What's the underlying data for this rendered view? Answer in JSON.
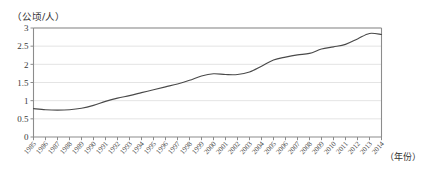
{
  "chart_data": {
    "type": "line",
    "title": "",
    "subtitle": "",
    "ylabel": "（公顷/人）",
    "xlabel": "（年份）",
    "xlabel_unit_text": "（年份）",
    "ylabel_unit_text": "（公顷/人）",
    "grid": true,
    "legend": "none",
    "ylim": [
      0,
      3
    ],
    "yticks": [
      0,
      0.5,
      1,
      1.5,
      2,
      2.5,
      3
    ],
    "ytick_labels": [
      "0",
      "0.5",
      "1",
      "1.5",
      "2",
      "2.5",
      "3"
    ],
    "xlim": [
      "1985",
      "2014"
    ],
    "categories": [
      "1985",
      "1986",
      "1987",
      "1988",
      "1989",
      "1990",
      "1991",
      "1992",
      "1993",
      "1994",
      "1995",
      "1996",
      "1997",
      "1998",
      "1999",
      "2000",
      "2001",
      "2002",
      "2003",
      "2004",
      "2005",
      "2006",
      "2007",
      "2008",
      "2009",
      "2010",
      "2011",
      "2012",
      "2013",
      "2014"
    ],
    "series": [
      {
        "name": "人均面积",
        "values": [
          0.78,
          0.75,
          0.74,
          0.75,
          0.79,
          0.87,
          0.98,
          1.07,
          1.14,
          1.22,
          1.3,
          1.38,
          1.46,
          1.56,
          1.68,
          1.74,
          1.72,
          1.72,
          1.79,
          1.95,
          2.12,
          2.2,
          2.26,
          2.3,
          2.42,
          2.48,
          2.55,
          2.7,
          2.85,
          2.82
        ]
      }
    ]
  },
  "axes": {
    "y_unit": "（公顷/人）",
    "x_unit": "（年份）"
  }
}
